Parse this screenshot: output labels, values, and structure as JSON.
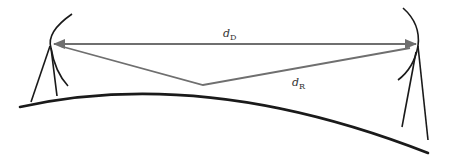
{
  "diagram": {
    "labels": {
      "direct_path": {
        "symbol": "d",
        "subscript": "D"
      },
      "reflected_path": {
        "symbol": "d",
        "subscript": "R"
      }
    },
    "colors": {
      "ray": "#6f6f6f",
      "structure": "#1a1a1a",
      "label": "#333333",
      "background": "#ffffff"
    },
    "elements": {
      "left_antenna": "transmitter antenna with dish on tripod",
      "right_antenna": "receiver antenna with dish on tripod",
      "ground": "curved earth surface",
      "direct_ray": "double-headed arrow between antennas",
      "reflected_ray": "ray reflecting off ground midpoint"
    }
  }
}
